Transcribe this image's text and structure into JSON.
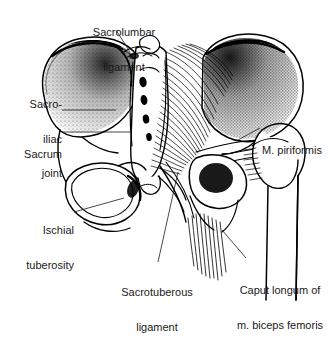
{
  "figure": {
    "kind": "anatomical-line-drawing",
    "background_color": "#ffffff",
    "ink_color": "#000000",
    "text_color": "#1a1a1a"
  },
  "labels": [
    {
      "id": "sacrolumbar-ligament",
      "line1": "Sacrolumbar",
      "line2": "ligament",
      "align": "center",
      "x": 72,
      "y": 4,
      "width": 104
    },
    {
      "id": "sacro-iliac-joint",
      "line1": "Sacro-",
      "line2": "iliac",
      "line3": "joint",
      "align": "right",
      "x": 2,
      "y": 76,
      "width": 60
    },
    {
      "id": "sacrum",
      "line1": "Sacrum",
      "align": "right",
      "x": 2,
      "y": 126,
      "width": 60
    },
    {
      "id": "ischial-tuberosity",
      "line1": "Ischial",
      "line2": "tuberosity",
      "align": "right",
      "x": 2,
      "y": 202,
      "width": 72
    },
    {
      "id": "m-piriformis",
      "line1": "M. piriformis",
      "align": "left",
      "x": 262,
      "y": 122,
      "width": 70
    },
    {
      "id": "sacrotuberous-ligament",
      "line1": "Sacrotuberous",
      "line2": "ligament",
      "align": "center",
      "x": 98,
      "y": 264,
      "width": 118
    },
    {
      "id": "caput-longum-biceps-femoris",
      "line1": "Caput longum of",
      "line2": "m. biceps femoris",
      "align": "center",
      "x": 230,
      "y": 262,
      "width": 100
    }
  ],
  "structures": [
    {
      "id": "left-ilium",
      "name": "Left iliac wing"
    },
    {
      "id": "right-ilium",
      "name": "Right iliac wing"
    },
    {
      "id": "sacrum-body",
      "name": "Sacrum with sacral foramina"
    },
    {
      "id": "piriformis-fibers",
      "name": "Fanned piriformis muscle fibers"
    },
    {
      "id": "left-obturator-foramen",
      "name": "Left obturator foramen"
    },
    {
      "id": "right-obturator-foramen",
      "name": "Right obturator foramen"
    },
    {
      "id": "femur",
      "name": "Right femur with greater trochanter"
    },
    {
      "id": "hamstring-tendon",
      "name": "Hamstring tendon fibers at ischial tuberosity"
    }
  ]
}
